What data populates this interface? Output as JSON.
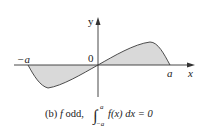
{
  "diagram": {
    "axes": {
      "x_label": "x",
      "y_label": "y",
      "origin_label": "0",
      "neg_a_label": "−a",
      "pos_a_label": "a"
    },
    "caption": {
      "prefix": "(b) ",
      "f": "f",
      "odd_text": " odd, ",
      "integral_sign": "∫",
      "upper_limit": "a",
      "lower_limit": "−a",
      "integrand": "f(x) dx = 0"
    },
    "colors": {
      "fill": "#d9d9d9",
      "curve": "#3a3a3a",
      "axis": "#333333"
    }
  }
}
